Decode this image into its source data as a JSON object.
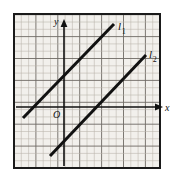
{
  "figure": {
    "kind": "coordinate-plane-graph-paper",
    "background_color": "#ffffff",
    "paper_color": "#f2f0ec",
    "frame": {
      "x": 14,
      "y": 14,
      "width": 146,
      "height": 154,
      "color": "#1a1a1a",
      "thickness": 2
    },
    "grid": {
      "minor_spacing": 7.3,
      "minor_color": "#b9b4ab",
      "major_every": 3,
      "major_color": "#6e6a64",
      "visible": true
    },
    "axes": {
      "x_axis": {
        "y": 107,
        "x_start": 16,
        "x_end": 156,
        "label": "x",
        "arrow": "right",
        "color": "#111111"
      },
      "y_axis": {
        "x": 64,
        "y_start": 166,
        "y_end": 26,
        "label": "y",
        "arrow": "up",
        "color": "#111111"
      },
      "origin_label": "O"
    },
    "lines": [
      {
        "name": "l-1",
        "label": "l",
        "subscript": "1",
        "x1": 23,
        "y1": 118,
        "x2": 114,
        "y2": 24,
        "color": "#111111",
        "thickness": 3,
        "label_x": 118,
        "label_y": 22
      },
      {
        "name": "l-2",
        "label": "l",
        "subscript": "2",
        "x1": 50,
        "y1": 156,
        "x2": 146,
        "y2": 55,
        "color": "#111111",
        "thickness": 3,
        "label_x": 149,
        "label_y": 50
      }
    ]
  }
}
